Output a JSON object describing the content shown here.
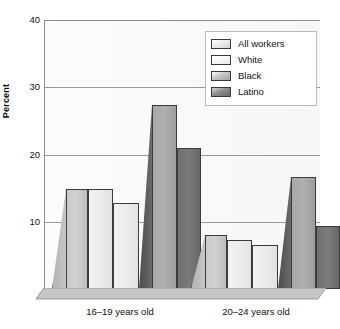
{
  "chart_data": {
    "type": "bar",
    "title": "",
    "subtitle": "",
    "xlabel": "",
    "ylabel": "Percent",
    "ylim": [
      0,
      40
    ],
    "yticks": [
      10,
      20,
      30,
      40
    ],
    "grid": true,
    "legend_position": "top-right",
    "categories": [
      "16–19 years old",
      "20–24 years old"
    ],
    "series": [
      {
        "name": "All workers",
        "values": [
          14.8,
          8.0
        ],
        "color": "#cccccc"
      },
      {
        "name": "White",
        "values": [
          14.8,
          7.3
        ],
        "color": "#eeeeec"
      },
      {
        "name": "Black",
        "values": [
          27.3,
          16.6
        ],
        "color": "#aaaaaa"
      },
      {
        "name": "Latino",
        "values": [
          21.0,
          9.4
        ],
        "color": "#707070"
      }
    ]
  },
  "axes": {
    "y_title": "Percent",
    "y_tick_labels": [
      "40",
      "30",
      "20",
      "10"
    ],
    "x_tick_labels": [
      "16–19 years old",
      "20–24 years old"
    ]
  },
  "legend": {
    "items": [
      {
        "label": "All workers"
      },
      {
        "label": "White"
      },
      {
        "label": "Black"
      },
      {
        "label": "Latino"
      }
    ]
  },
  "colors": {
    "plot_background": "#f9f9f9",
    "gridline": "#9a9a9a",
    "axis": "#8e8e8e",
    "floor": "#c4c4c4",
    "text": "#111111"
  }
}
